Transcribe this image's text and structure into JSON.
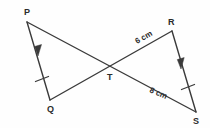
{
  "figure": {
    "type": "geometry-diagram",
    "background_color": "#fefefe",
    "stroke_color": "#3a3a3a",
    "text_color": "#2b2b2b",
    "vertices": [
      {
        "name": "P",
        "label": "P",
        "x": 27,
        "y": 22,
        "label_x": 24,
        "label_y": 15
      },
      {
        "name": "Q",
        "label": "Q",
        "x": 50,
        "y": 100,
        "label_x": 47,
        "label_y": 112
      },
      {
        "name": "T",
        "label": "T",
        "x": 110,
        "y": 67,
        "label_x": 107,
        "label_y": 80
      },
      {
        "name": "R",
        "label": "R",
        "x": 172,
        "y": 31,
        "label_x": 168,
        "label_y": 25
      },
      {
        "name": "S",
        "label": "S",
        "x": 196,
        "y": 112,
        "label_x": 193,
        "label_y": 124
      }
    ],
    "segments": [
      {
        "name": "PQ",
        "from": "P",
        "to": "Q",
        "has_arrow": true,
        "has_tick": true
      },
      {
        "name": "PS",
        "from": "P",
        "to": "S",
        "has_arrow": false,
        "has_tick": false
      },
      {
        "name": "QR",
        "from": "Q",
        "to": "R",
        "has_arrow": false,
        "has_tick": false
      },
      {
        "name": "RS",
        "from": "R",
        "to": "S",
        "has_arrow": true,
        "has_tick": true
      }
    ],
    "measures": [
      {
        "name": "TR",
        "label": "6 cm",
        "value": 6,
        "unit": "cm",
        "x": 137,
        "y": 44,
        "rotation": -30
      },
      {
        "name": "TS",
        "label": "8 cm",
        "value": 8,
        "unit": "cm",
        "x": 149,
        "y": 92,
        "rotation": 23
      }
    ]
  }
}
